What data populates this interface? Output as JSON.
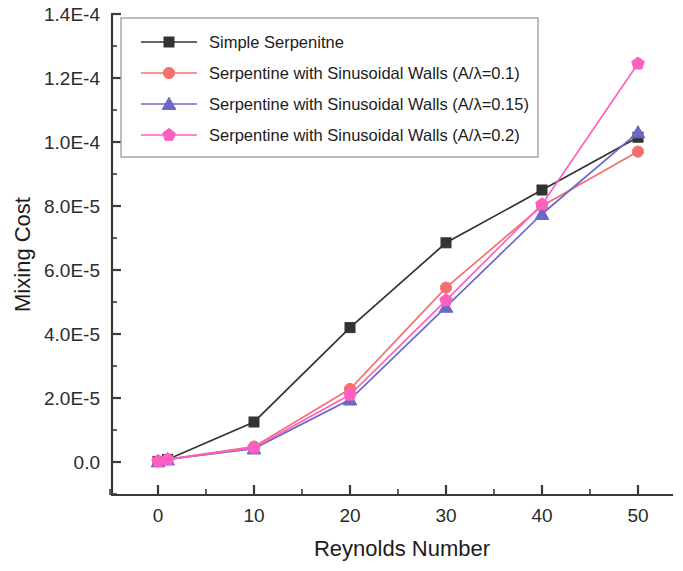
{
  "chart_data": {
    "type": "line",
    "title": "",
    "xlabel": "Reynolds Number",
    "ylabel": "Mixing Cost",
    "xlim": [
      -5,
      55
    ],
    "ylim": [
      0,
      0.00014
    ],
    "grid": false,
    "legend_position": "top-left-inside",
    "x_ticks": [
      "0",
      "10",
      "20",
      "30",
      "40",
      "50"
    ],
    "x_tick_values": [
      0,
      10,
      20,
      30,
      40,
      50
    ],
    "y_ticks": [
      "0.0",
      "2.0E-5",
      "4.0E-5",
      "6.0E-5",
      "8.0E-5",
      "1.0E-4",
      "1.2E-4",
      "1.4E-4"
    ],
    "y_tick_values": [
      0,
      2e-05,
      4e-05,
      6e-05,
      8e-05,
      0.0001,
      0.00012,
      0.00014
    ],
    "series": [
      {
        "name": "Simple Serpenitne",
        "color": "#333333",
        "marker": "square",
        "x": [
          0,
          1,
          10,
          20,
          30,
          40,
          50
        ],
        "values": [
          2e-07,
          8e-07,
          1.25e-05,
          4.2e-05,
          6.85e-05,
          8.5e-05,
          0.0001015
        ]
      },
      {
        "name": "Serpentine with Sinusoidal Walls (A/λ=0.1)",
        "color": "#f4706e",
        "marker": "circle",
        "x": [
          0,
          1,
          10,
          20,
          30,
          40,
          50
        ],
        "values": [
          2e-07,
          8e-07,
          4.8e-06,
          2.28e-05,
          5.45e-05,
          8e-05,
          9.7e-05
        ]
      },
      {
        "name": "Serpentine with Sinusoidal Walls (A/λ=0.15)",
        "color": "#6a68c8",
        "marker": "triangle",
        "x": [
          0,
          1,
          10,
          20,
          30,
          40,
          50
        ],
        "values": [
          2e-07,
          8e-07,
          4.2e-06,
          1.95e-05,
          4.85e-05,
          7.75e-05,
          0.000103
        ]
      },
      {
        "name": "Serpentine with Sinusoidal Walls (A/λ=0.2)",
        "color": "#ff5fc0",
        "marker": "pentagon",
        "x": [
          0,
          1,
          10,
          20,
          30,
          40,
          50
        ],
        "values": [
          2e-07,
          8e-07,
          4.5e-06,
          2.1e-05,
          5.05e-05,
          8.05e-05,
          0.0001245
        ]
      }
    ]
  }
}
